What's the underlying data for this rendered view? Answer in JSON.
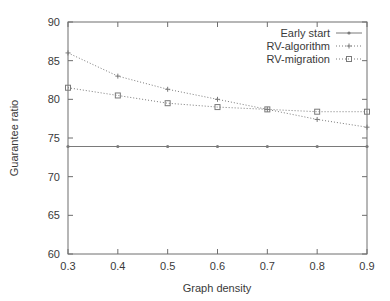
{
  "chart_data": {
    "type": "line",
    "title": "",
    "xlabel": "Graph density",
    "ylabel": "Guarantee ratio",
    "x": [
      0.3,
      0.4,
      0.5,
      0.6,
      0.7,
      0.8,
      0.9
    ],
    "xtick_labels": [
      "0.3",
      "0.4",
      "0.5",
      "0.6",
      "0.7",
      "0.8",
      "0.9"
    ],
    "ytick_labels": [
      "60",
      "65",
      "70",
      "75",
      "80",
      "85",
      "90"
    ],
    "yticks": [
      60,
      65,
      70,
      75,
      80,
      85,
      90
    ],
    "xlim": [
      0.3,
      0.9
    ],
    "ylim": [
      60,
      90
    ],
    "grid": false,
    "legend_position": "top-right-inside",
    "series": [
      {
        "name": "Early start",
        "marker": "dot",
        "line_style": "solid",
        "color": "#7a7a7a",
        "values": [
          73.9,
          73.9,
          73.9,
          73.9,
          73.9,
          73.9,
          73.9
        ]
      },
      {
        "name": "RV-algorithm",
        "marker": "plus",
        "line_style": "dotted",
        "color": "#7a7a7a",
        "values": [
          86.0,
          83.0,
          81.3,
          80.0,
          78.7,
          77.4,
          76.4
        ]
      },
      {
        "name": "RV-migration",
        "marker": "square",
        "line_style": "dotted",
        "color": "#7a7a7a",
        "values": [
          81.5,
          80.5,
          79.5,
          79.0,
          78.7,
          78.4,
          78.4
        ]
      }
    ]
  }
}
